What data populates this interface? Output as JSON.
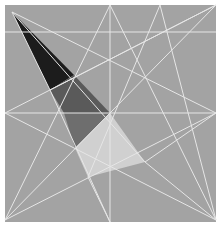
{
  "figure": {
    "title": "",
    "colors": {
      "background": "#ffffff",
      "square_fill": "#a3a3a3",
      "line": "#e6e6e6",
      "dark_triangle": "#1c1c1c",
      "mid_dark_region": "#5e5e5e",
      "medium_region": "#6f6f6f",
      "light_region": "#d2d2d2"
    },
    "square": {
      "x": 5,
      "y": 5,
      "width": 211,
      "height": 217
    },
    "shaded_regions": [
      {
        "name": "dark-triangle",
        "points": "12,12 74,75 50,90",
        "fill": "#1c1c1c"
      },
      {
        "name": "mid-dark-region",
        "points": "50,90 74,75 110,113 64,113",
        "fill": "#5a5a5a"
      },
      {
        "name": "medium-region",
        "points": "64,113 110,113 75,148",
        "fill": "#6e6e6e"
      },
      {
        "name": "light-region",
        "points": "110,113 145,162 88,177 75,148",
        "fill": "#d0d0d0"
      }
    ],
    "lines": [
      {
        "x1": 5,
        "y1": 32,
        "x2": 216,
        "y2": 32
      },
      {
        "x1": 5,
        "y1": 113,
        "x2": 216,
        "y2": 113
      },
      {
        "x1": 110,
        "y1": 5,
        "x2": 110,
        "y2": 222
      },
      {
        "x1": 12,
        "y1": 12,
        "x2": 216,
        "y2": 113
      },
      {
        "x1": 5,
        "y1": 113,
        "x2": 216,
        "y2": 5
      },
      {
        "x1": 5,
        "y1": 220,
        "x2": 216,
        "y2": 5
      },
      {
        "x1": 5,
        "y1": 220,
        "x2": 110,
        "y2": 5
      },
      {
        "x1": 110,
        "y1": 5,
        "x2": 216,
        "y2": 220
      },
      {
        "x1": 5,
        "y1": 113,
        "x2": 216,
        "y2": 220
      },
      {
        "x1": 12,
        "y1": 12,
        "x2": 145,
        "y2": 162
      },
      {
        "x1": 50,
        "y1": 90,
        "x2": 216,
        "y2": 5
      },
      {
        "x1": 5,
        "y1": 220,
        "x2": 216,
        "y2": 113
      },
      {
        "x1": 88,
        "y1": 177,
        "x2": 110,
        "y2": 222
      },
      {
        "x1": 160,
        "y1": 5,
        "x2": 88,
        "y2": 177
      },
      {
        "x1": 145,
        "y1": 162,
        "x2": 216,
        "y2": 220
      },
      {
        "x1": 12,
        "y1": 12,
        "x2": 50,
        "y2": 90
      },
      {
        "x1": 50,
        "y1": 90,
        "x2": 110,
        "y2": 222
      },
      {
        "x1": 145,
        "y1": 162,
        "x2": 216,
        "y2": 113
      },
      {
        "x1": 160,
        "y1": 5,
        "x2": 216,
        "y2": 220
      }
    ]
  }
}
